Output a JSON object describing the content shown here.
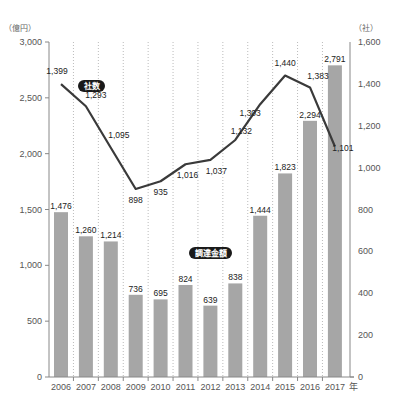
{
  "chart_data": {
    "type": "bar+line",
    "title": "",
    "categories": [
      "2006",
      "2007",
      "2008",
      "2009",
      "2010",
      "2011",
      "2012",
      "2013",
      "2014",
      "2015",
      "2016",
      "2017"
    ],
    "x_suffix": "年",
    "series": [
      {
        "name": "調達金額",
        "type": "bar",
        "axis": "left",
        "unit": "（億円）",
        "values": [
          1476,
          1260,
          1214,
          736,
          695,
          824,
          639,
          838,
          1444,
          1823,
          2294,
          2791
        ],
        "labels": [
          "1,476",
          "1,260",
          "1,214",
          "736",
          "695",
          "824",
          "639",
          "838",
          "1,444",
          "1,823",
          "2,294",
          "2,791"
        ],
        "color": "#a6a6a6"
      },
      {
        "name": "社数",
        "type": "line",
        "axis": "right",
        "unit": "（社）",
        "values": [
          1399,
          1293,
          1095,
          898,
          935,
          1016,
          1037,
          1132,
          1303,
          1440,
          1383,
          1101
        ],
        "labels": [
          "1,399",
          "1,293",
          "1,095",
          "898",
          "935",
          "1,016",
          "1,037",
          "1,132",
          "1,303",
          "1,440",
          "1,383",
          "1,101"
        ],
        "color": "#3a3a3a"
      }
    ],
    "left_axis": {
      "unit": "（億円）",
      "ylim": [
        0,
        3000
      ],
      "ticks": [
        0,
        500,
        1000,
        1500,
        2000,
        2500,
        3000
      ],
      "tick_labels": [
        "0",
        "500",
        "1,000",
        "1,500",
        "2,000",
        "2,500",
        "3,000"
      ]
    },
    "right_axis": {
      "unit": "（社）",
      "ylim": [
        0,
        1600
      ],
      "ticks": [
        0,
        200,
        400,
        600,
        800,
        1000,
        1200,
        1400,
        1600
      ],
      "tick_labels": [
        "0",
        "200",
        "400",
        "600",
        "800",
        "1,000",
        "1,200",
        "1,400",
        "1,600"
      ]
    },
    "legend": {
      "bar_tag": "調達金額",
      "line_tag": "社数"
    },
    "grid": "vertical dotted between categories"
  }
}
